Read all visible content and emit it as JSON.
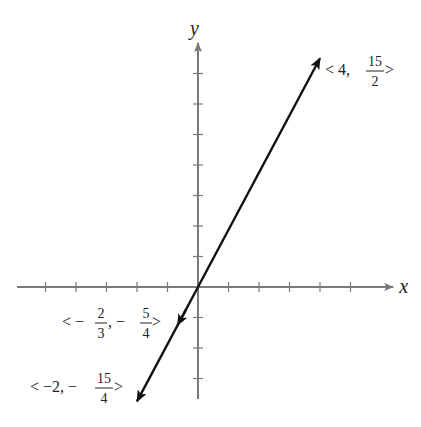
{
  "diagram": {
    "type": "coordinate-plane-line",
    "x_axis_label": "x",
    "y_axis_label": "y",
    "origin_px": [
      198,
      287
    ],
    "unit_px": 30.5,
    "x_ticks": [
      -5,
      -4,
      -3,
      -2,
      -1,
      1,
      2,
      3,
      4,
      5
    ],
    "y_ticks": [
      -3,
      -2,
      -1,
      1,
      2,
      3,
      4,
      5,
      6,
      7
    ],
    "x_range": [
      -6,
      6.4
    ],
    "y_range": [
      -4,
      8.2
    ],
    "axis_color": "#7a7a7a",
    "line_color": "#111111",
    "line": {
      "slope": "15/8",
      "through_origin": true,
      "arrow_ends": [
        [
          4,
          7.5
        ],
        [
          -2,
          -3.75
        ]
      ],
      "interior_arrow_at": [
        -0.667,
        -1.25
      ]
    },
    "labels": [
      {
        "id": "point-top",
        "prefix": "< 4, ",
        "num": "15",
        "den": "2",
        "suffix": " >",
        "value": [
          4,
          7.5
        ]
      },
      {
        "id": "point-mid",
        "prefix": "< −",
        "frac1_num": "2",
        "frac1_den": "3",
        "middle": ", −",
        "num": "5",
        "den": "4",
        "suffix": " >",
        "value": [
          -0.667,
          -1.25
        ]
      },
      {
        "id": "point-bottom",
        "prefix": "< −2, −",
        "num": "15",
        "den": "4",
        "suffix": " >",
        "value": [
          -2,
          -3.75
        ]
      }
    ]
  },
  "chart_data": {
    "type": "line",
    "title": "",
    "xlabel": "x",
    "ylabel": "y",
    "x": [
      -2,
      -0.6667,
      0,
      4
    ],
    "y": [
      -3.75,
      -1.25,
      0,
      7.5
    ],
    "annotations": [
      "<4, 15/2>",
      "<-2/3, -5/4>",
      "<-2, -15/4>"
    ],
    "xlim": [
      -6,
      6
    ],
    "ylim": [
      -4,
      8
    ],
    "grid": false
  }
}
